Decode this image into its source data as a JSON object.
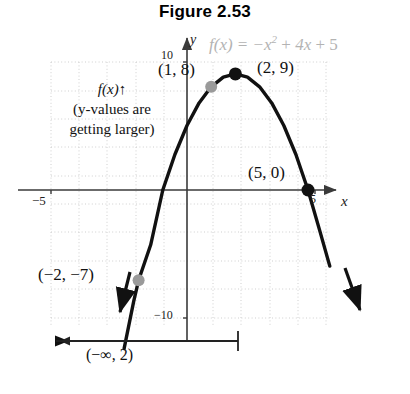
{
  "figure": {
    "title": "Figure 2.53",
    "equation_prefix": "f",
    "equation_text": "f(x) = −x² + 4x + 5",
    "equation_color": "#b3b3b3"
  },
  "axes": {
    "x_label": "x",
    "y_label": "y",
    "ticks": {
      "y_top": "10",
      "y_bottom": "−10",
      "x_left": "−5",
      "x_right": "5"
    },
    "grid": true,
    "grid_color": "#cfcfcf",
    "axis_color": "#3a3a3a"
  },
  "annotations": {
    "point_1_8": "(1, 8)",
    "point_2_9": "(2, 9)",
    "point_5_0": "(5, 0)",
    "point_neg2_neg7": "(−2, −7)",
    "increasing_note_line1_fx": "f(x)",
    "increasing_note_line1_arrow": "↑",
    "increasing_note_line2": "(y-values are",
    "increasing_note_line3": "getting larger)",
    "interval_label": "(−∞, 2)"
  },
  "markers": {
    "filled_color": "#111111",
    "open_color": "#9a9a9a",
    "curve_color": "#111111"
  },
  "chart_data": {
    "type": "line",
    "title": "Figure 2.53",
    "function": "f(x) = -x^2 + 4x + 5",
    "xlabel": "x",
    "ylabel": "y",
    "xlim": [
      -5.8,
      5.8
    ],
    "ylim": [
      -11.5,
      11.5
    ],
    "grid": true,
    "x": [
      -2.6,
      -2.2,
      -2.0,
      -1.5,
      -1.0,
      -0.5,
      0.0,
      0.5,
      1.0,
      1.5,
      2.0,
      2.5,
      3.0,
      3.5,
      4.0,
      4.5,
      5.0,
      5.5,
      5.9
    ],
    "y": [
      -12.3,
      -8.6,
      -7.0,
      -4.25,
      0.0,
      2.75,
      5.0,
      6.75,
      8.0,
      8.75,
      9.0,
      8.75,
      8.0,
      6.75,
      5.0,
      2.75,
      0.0,
      -3.25,
      -5.9
    ],
    "labeled_points": [
      {
        "label": "(1, 8)",
        "x": 1,
        "y": 8,
        "style": "gray-dot"
      },
      {
        "label": "(2, 9)",
        "x": 2,
        "y": 9,
        "style": "black-dot"
      },
      {
        "label": "(5, 0)",
        "x": 5,
        "y": 0,
        "style": "black-dot"
      },
      {
        "label": "(−2, −7)",
        "x": -2,
        "y": -7,
        "style": "gray-dot"
      }
    ],
    "annotations": [
      {
        "text": "f(x)↑ (y-values are getting larger)",
        "x": -3.6,
        "y": 6.5
      },
      {
        "text": "(−∞, 2)",
        "x": -2.0,
        "y": -13.5
      }
    ],
    "interval_bar": {
      "label": "(−∞, 2)",
      "from": "-infinity",
      "to": 2,
      "open_right": true
    }
  }
}
